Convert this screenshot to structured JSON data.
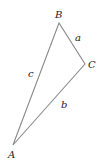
{
  "diagram": {
    "type": "triangle",
    "stroke_color": "#8a8a8a",
    "label_color": "#222222",
    "vertices": {
      "A": {
        "label": "A",
        "x": 13,
        "y": 145
      },
      "B": {
        "label": "B",
        "x": 59,
        "y": 23
      },
      "C": {
        "label": "C",
        "x": 85,
        "y": 64
      }
    },
    "sides": {
      "a": {
        "label": "a",
        "from": "B",
        "to": "C"
      },
      "b": {
        "label": "b",
        "from": "C",
        "to": "A"
      },
      "c": {
        "label": "c",
        "from": "A",
        "to": "B"
      }
    }
  }
}
